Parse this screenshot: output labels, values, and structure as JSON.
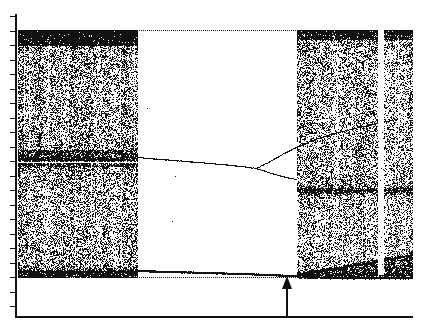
{
  "figure": {
    "kind": "bifurcation-diagram",
    "background_color": "#ffffff",
    "ink_color": "#111111"
  },
  "axes": {
    "y_axis_name": "y-axis",
    "x_axis_name": "x-axis",
    "y_tick_count": 21,
    "x_tick_count": 10,
    "x_tick_positions_px": [
      55,
      95,
      135,
      175,
      215,
      255,
      295,
      335,
      375,
      411
    ],
    "y_tick_top_px": 16,
    "y_tick_spacing_px": 14.5
  },
  "marker": {
    "name": "up-arrow-marker",
    "direction": "up",
    "x_px": 287,
    "label": ""
  },
  "chart_data": {
    "type": "scatter",
    "title": "",
    "xlabel": "",
    "ylabel": "",
    "xlim": [
      0,
      1
    ],
    "ylim": [
      0,
      1
    ],
    "grid": false,
    "legend": null,
    "regions": [
      {
        "name": "left-chaotic-band-upper",
        "kind": "chaotic",
        "x_range_px": [
          18,
          137
        ],
        "y_range_px": [
          30,
          160
        ],
        "density": 0.62
      },
      {
        "name": "left-chaotic-band-lower",
        "kind": "chaotic",
        "x_range_px": [
          18,
          137
        ],
        "y_range_px": [
          163,
          272
        ],
        "density": 0.55
      },
      {
        "name": "central-periodic-window",
        "kind": "periodic",
        "x_range_px": [
          137,
          297
        ],
        "y_range_px": [
          30,
          275
        ],
        "density": 0.0
      },
      {
        "name": "right-chaotic-band-upper",
        "kind": "chaotic",
        "x_range_px": [
          297,
          412
        ],
        "y_range_px": [
          30,
          190
        ],
        "density": 0.5
      },
      {
        "name": "right-chaotic-band-lower",
        "kind": "chaotic",
        "x_range_px": [
          297,
          412
        ],
        "y_range_px": [
          190,
          275
        ],
        "density": 0.48
      },
      {
        "name": "right-periodic-stripe",
        "kind": "periodic-window",
        "x_range_px": [
          378,
          384
        ],
        "y_range_px": [
          30,
          275
        ],
        "density": 0.05
      }
    ],
    "branches": [
      {
        "name": "upper-branch-main",
        "points_px": [
          [
            137,
            157
          ],
          [
            160,
            159
          ],
          [
            185,
            161
          ],
          [
            210,
            163
          ],
          [
            232,
            165
          ],
          [
            248,
            167
          ],
          [
            256,
            168
          ]
        ],
        "note": "single attractor branch drifting slowly downward"
      },
      {
        "name": "upper-branch-split-a",
        "points_px": [
          [
            256,
            168
          ],
          [
            268,
            162
          ],
          [
            282,
            154
          ],
          [
            296,
            147
          ],
          [
            312,
            140
          ],
          [
            330,
            134
          ],
          [
            350,
            129
          ],
          [
            372,
            124
          ],
          [
            396,
            119
          ]
        ],
        "note": "upper arm after period doubling"
      },
      {
        "name": "upper-branch-split-b",
        "points_px": [
          [
            256,
            168
          ],
          [
            268,
            172
          ],
          [
            282,
            176
          ],
          [
            290,
            178
          ],
          [
            296,
            179
          ]
        ],
        "note": "lower arm after period doubling, merges into chaos"
      },
      {
        "name": "lower-branch-main",
        "points_px": [
          [
            137,
            270
          ],
          [
            170,
            271
          ],
          [
            205,
            272
          ],
          [
            240,
            273
          ],
          [
            268,
            274
          ],
          [
            290,
            275
          ],
          [
            297,
            275
          ]
        ],
        "note": "near-constant low branch crossing the periodic window"
      },
      {
        "name": "lower-branch-fan-upper",
        "points_px": [
          [
            297,
            273
          ],
          [
            320,
            270
          ],
          [
            345,
            266
          ],
          [
            370,
            262
          ],
          [
            392,
            258
          ],
          [
            412,
            254
          ]
        ],
        "note": "upper edge of expanding lower chaotic wedge"
      },
      {
        "name": "lower-branch-fan-lower",
        "points_px": [
          [
            297,
            276
          ],
          [
            330,
            277
          ],
          [
            365,
            277
          ],
          [
            400,
            277
          ],
          [
            412,
            277
          ]
        ],
        "note": "lower edge of expanding lower chaotic wedge"
      }
    ],
    "edges": [
      {
        "name": "top-envelope",
        "points_px": [
          [
            18,
            30
          ],
          [
            137,
            30
          ],
          [
            297,
            30
          ],
          [
            412,
            30
          ]
        ],
        "note": "dotted upper boundary of the attractor spanning full width"
      },
      {
        "name": "bottom-envelope",
        "points_px": [
          [
            18,
            277
          ],
          [
            137,
            277
          ],
          [
            297,
            277
          ],
          [
            412,
            277
          ]
        ],
        "note": "lower boundary of the attractor"
      }
    ]
  }
}
